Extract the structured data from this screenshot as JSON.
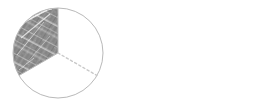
{
  "figure": {
    "title": "Equivalent fractions circle diagram",
    "description": "A circle divided into three equal sectors with one sector shaded, an equals sign, and a circle divided into six equal sectors.",
    "background_color": "#ffffff"
  },
  "chart_data": {
    "type": "pie",
    "title": "Equivalent fractions circle diagram",
    "xlabel": "",
    "ylabel": "",
    "charts": [
      {
        "name": "left-circle",
        "type": "pie",
        "slice_count": 3,
        "categories": [
          "shaded-sector",
          "unshaded-sector-right",
          "unshaded-sector-bottom"
        ],
        "values": [
          1,
          1,
          1
        ],
        "shaded_slices": 1,
        "fraction": "1/3",
        "center_x": 58,
        "center_y": 53,
        "radius": 45,
        "divider_angles_deg": [
          90,
          210,
          330
        ],
        "divider_style": "dashed",
        "outline_color": "#b9b9b9",
        "divider_color": "#c9c9c9",
        "shade_color": "#8a8a8a",
        "shade_texture": "mottled-pencil"
      },
      {
        "name": "right-circle",
        "type": "pie",
        "slice_count": 6,
        "categories": [
          "s1",
          "s2",
          "s3",
          "s4",
          "s5",
          "s6"
        ],
        "values": [
          1,
          1,
          1,
          1,
          1,
          1
        ],
        "shaded_slices": 0,
        "fraction": "2/6",
        "center_x": 200,
        "center_y": 54,
        "radius": 44,
        "divider_angles_deg": [
          90,
          150,
          210,
          270,
          330,
          30
        ],
        "divider_style": "dashed",
        "outline_color": "#bdbdbd",
        "divider_color": "#cfcfcf",
        "shade_color": "none"
      }
    ],
    "annotations": [
      {
        "name": "equals-sign",
        "symbol": "=",
        "x": 129,
        "y": 52,
        "color": "#111111",
        "bar_width": 25,
        "bar_height": 4,
        "bar_gap": 6
      }
    ],
    "legend": [],
    "grid": false
  },
  "colors": {
    "background": "#ffffff",
    "circle_outline": "#b9b9b9",
    "divider_line": "#cbcbcb",
    "shade_fill": "#8a8a8a",
    "shade_fill_dark": "#6f6f6f",
    "shade_fill_light": "#a6a6a6",
    "equals_sign": "#131313"
  },
  "labels": {
    "left_circle": "Circle divided into thirds with one third shaded",
    "equals": "=",
    "right_circle": "Circle divided into sixths, unshaded"
  }
}
